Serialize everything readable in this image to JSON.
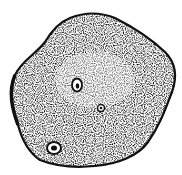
{
  "image": {
    "subject": "potato",
    "style": "stippled ink drawing",
    "colors": {
      "ink": "#111111",
      "background": "#ffffff"
    },
    "features": [
      {
        "name": "eye-upper-left",
        "cx": 77,
        "cy": 85,
        "r": 6
      },
      {
        "name": "eye-center",
        "cx": 101,
        "cy": 108,
        "r": 3.5
      },
      {
        "name": "eye-lower-left",
        "cx": 54,
        "cy": 148,
        "r": 7
      }
    ]
  }
}
